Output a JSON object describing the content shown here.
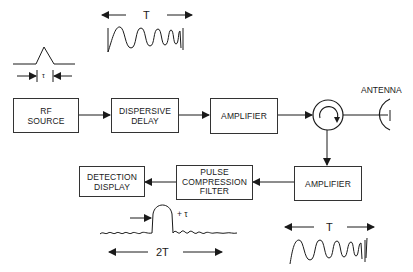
{
  "diagram": {
    "blocks": {
      "rf_source": {
        "line1": "RF",
        "line2": "SOURCE"
      },
      "dispersive_delay": {
        "line1": "DISPERSIVE",
        "line2": "DELAY"
      },
      "amplifier_tx": {
        "line1": "AMPLIFIER"
      },
      "amplifier_rx": {
        "line1": "AMPLIFIER"
      },
      "pulse_compression_filter": {
        "line1": "PULSE",
        "line2": "COMPRESSION",
        "line3": "FILTER"
      },
      "detection_display": {
        "line1": "DETECTION",
        "line2": "DISPLAY"
      }
    },
    "circulator": {
      "icon": "circulator-icon"
    },
    "antenna": {
      "label": "ANTENNA",
      "icon": "antenna-dish-icon"
    },
    "waveforms": {
      "short_pulse": {
        "width_label": "τ"
      },
      "chirp_tx": {
        "width_label": "T"
      },
      "chirp_rx": {
        "width_label": "T"
      },
      "compressed_pulse": {
        "width_label": "+ τ",
        "span_label": "2T"
      }
    },
    "connections": [
      "RF SOURCE -> DISPERSIVE DELAY",
      "DISPERSIVE DELAY -> AMPLIFIER",
      "AMPLIFIER -> CIRCULATOR",
      "CIRCULATOR -> ANTENNA",
      "CIRCULATOR -> AMPLIFIER",
      "AMPLIFIER -> PULSE COMPRESSION FILTER",
      "PULSE COMPRESSION FILTER -> DETECTION DISPLAY"
    ],
    "colors": {
      "line": "#1a1a1a",
      "background": "#ffffff"
    }
  }
}
